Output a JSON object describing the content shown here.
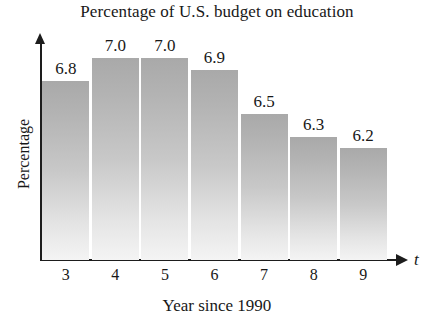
{
  "chart_data": {
    "type": "bar",
    "title": "Percentage of U.S. budget on education",
    "xlabel": "Year since 1990",
    "ylabel": "Percentage",
    "x_axis_variable": "t",
    "categories": [
      "3",
      "4",
      "5",
      "6",
      "7",
      "8",
      "9"
    ],
    "values": [
      6.8,
      7.0,
      7.0,
      6.9,
      6.5,
      6.3,
      6.2
    ],
    "value_labels": [
      "6.8",
      "7.0",
      "7.0",
      "6.9",
      "6.5",
      "6.3",
      "6.2"
    ],
    "ylim": [
      5.2,
      7.2
    ],
    "grid": false,
    "legend": null,
    "bar_color_top": "#a9a9a9",
    "bar_color_bottom": "#f4f4f4",
    "axis_color": "#1d1d1d",
    "text_color": "#181818"
  }
}
